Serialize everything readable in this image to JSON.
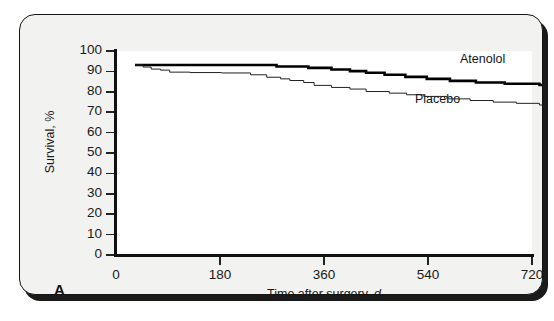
{
  "figure": {
    "panel_letter": "A",
    "background_color": "#f2f2f0",
    "plot_background_color": "#ffffff",
    "border_color": "#141414"
  },
  "chart_data": {
    "type": "line",
    "title": "",
    "subtitle": "",
    "xlabel": "Time after surgery, d",
    "xlabel_text": "Time after surgery,",
    "xlabel_unit": "d",
    "ylabel": "Survival, %",
    "xlim": [
      0,
      720
    ],
    "ylim": [
      0,
      100
    ],
    "xticks": [
      0,
      180,
      360,
      540,
      720
    ],
    "xtick_labels": [
      "0",
      "180",
      "360",
      "540",
      "720"
    ],
    "yticks": [
      0,
      10,
      20,
      30,
      40,
      50,
      60,
      70,
      80,
      90,
      100
    ],
    "ytick_labels": [
      "0",
      "10",
      "20",
      "30",
      "40",
      "50",
      "60",
      "70",
      "80",
      "90",
      "100"
    ],
    "grid": false,
    "legend_position": "inline-annotation",
    "annotations": [
      {
        "text": "Atenolol",
        "x": 700,
        "y": 93
      },
      {
        "text": "Placebo",
        "x": 620,
        "y": 81
      }
    ],
    "series": [
      {
        "name": "Atenolol",
        "style": "step",
        "line_width": 2.6,
        "color": "#000000",
        "x": [
          0,
          232,
          245,
          268,
          300,
          340,
          372,
          400,
          432,
          468,
          505,
          545,
          590,
          640,
          700,
          720
        ],
        "y": [
          100,
          100,
          99.3,
          99.3,
          98.6,
          97.8,
          97.0,
          96.2,
          95.2,
          94.2,
          93.2,
          92.2,
          91.4,
          90.8,
          90.2,
          90.0
        ]
      },
      {
        "name": "Placebo",
        "style": "step",
        "line_width": 1.0,
        "color": "#222222",
        "x": [
          0,
          14,
          28,
          44,
          60,
          95,
          150,
          200,
          228,
          252,
          268,
          292,
          310,
          340,
          372,
          400,
          440,
          470,
          500,
          540,
          580,
          620,
          660,
          700,
          720
        ],
        "y": [
          100,
          99.0,
          98.0,
          97.5,
          96.5,
          96.3,
          96.1,
          95.2,
          94.0,
          93.2,
          92.4,
          91.4,
          90.0,
          89.0,
          88.2,
          87.0,
          86.2,
          85.4,
          84.6,
          83.4,
          82.6,
          81.8,
          81.2,
          80.4,
          80.0
        ]
      }
    ]
  }
}
